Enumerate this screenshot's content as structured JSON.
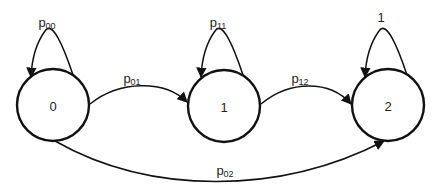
{
  "diagram": {
    "type": "markov-chain-state-diagram",
    "states": [
      {
        "id": "0",
        "label": "0",
        "cx": 53,
        "cy": 105,
        "r": 36
      },
      {
        "id": "1",
        "label": "1",
        "cx": 224,
        "cy": 106,
        "r": 36
      },
      {
        "id": "2",
        "label": "2",
        "cx": 388,
        "cy": 105,
        "r": 36
      }
    ],
    "transitions": [
      {
        "from": "0",
        "to": "0",
        "label_main": "p",
        "label_sub": "00"
      },
      {
        "from": "0",
        "to": "1",
        "label_main": "p",
        "label_sub": "01"
      },
      {
        "from": "1",
        "to": "1",
        "label_main": "p",
        "label_sub": "11"
      },
      {
        "from": "1",
        "to": "2",
        "label_main": "p",
        "label_sub": "12"
      },
      {
        "from": "0",
        "to": "2",
        "label_main": "p",
        "label_sub": "02"
      },
      {
        "from": "2",
        "to": "2",
        "label_main": "1",
        "label_sub": ""
      }
    ],
    "colors": {
      "stroke": "#111111",
      "text": "#222222",
      "background": "#ffffff"
    }
  }
}
